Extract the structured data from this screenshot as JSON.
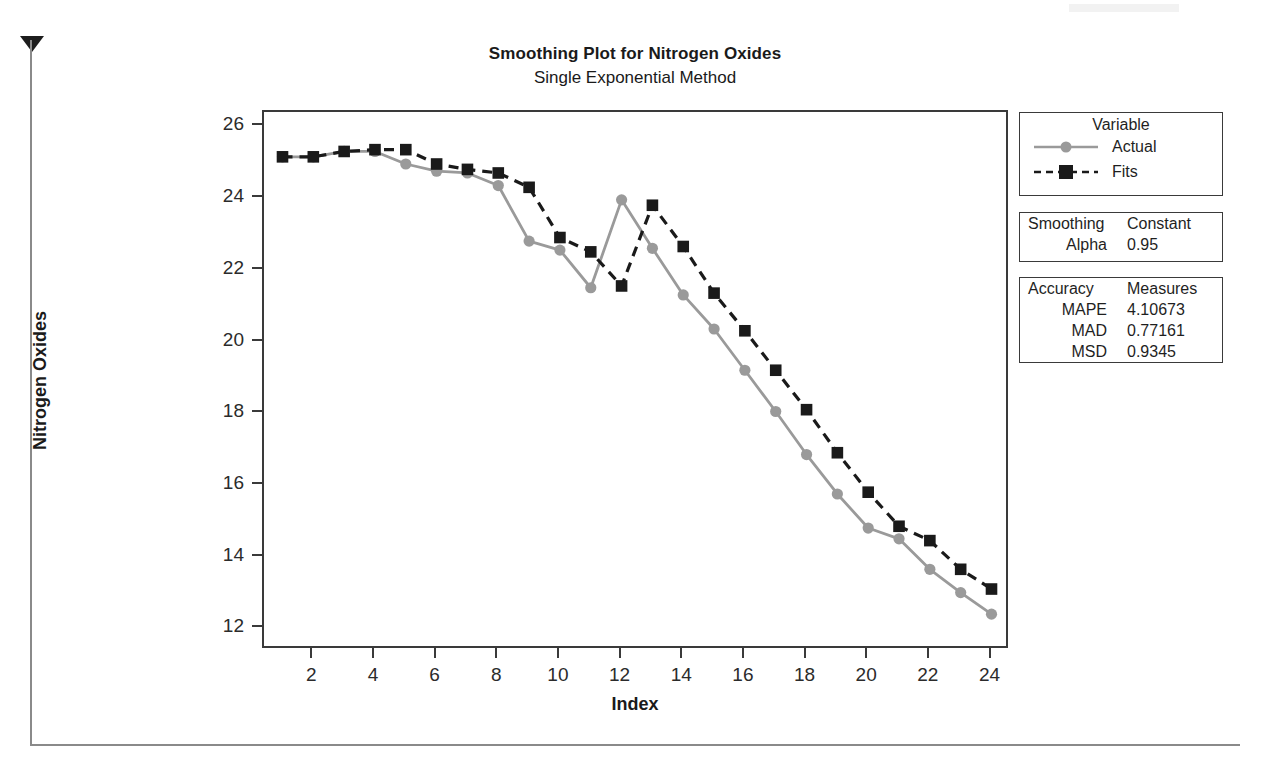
{
  "chart_data": {
    "type": "line",
    "title": "Smoothing Plot for Nitrogen Oxides",
    "subtitle": "Single Exponential Method",
    "xlabel": "Index",
    "ylabel": "Nitrogen Oxides",
    "grid": false,
    "legend_position": "right",
    "xlim": [
      0.4,
      24.6
    ],
    "ylim": [
      11.4,
      26.4
    ],
    "xticks": [
      2,
      4,
      6,
      8,
      10,
      12,
      14,
      16,
      18,
      20,
      22,
      24
    ],
    "yticks": [
      12,
      14,
      16,
      18,
      20,
      22,
      24,
      26
    ],
    "x": [
      1,
      2,
      3,
      4,
      5,
      6,
      7,
      8,
      9,
      10,
      11,
      12,
      13,
      14,
      15,
      16,
      17,
      18,
      19,
      20,
      21,
      22,
      23,
      24
    ],
    "series": [
      {
        "name": "Actual",
        "color": "#9a9a9a",
        "style": "solid",
        "marker": "circle",
        "values": [
          25.15,
          25.15,
          25.3,
          25.3,
          24.95,
          24.75,
          24.7,
          24.35,
          22.8,
          22.55,
          21.5,
          23.95,
          22.6,
          21.3,
          20.35,
          19.2,
          18.05,
          16.85,
          15.75,
          14.8,
          14.5,
          13.65,
          13.0,
          12.4
        ]
      },
      {
        "name": "Fits",
        "color": "#1a1a1a",
        "style": "dashed",
        "marker": "square",
        "values": [
          25.15,
          25.15,
          25.3,
          25.35,
          25.35,
          24.95,
          24.8,
          24.7,
          24.3,
          22.9,
          22.5,
          21.55,
          23.8,
          22.65,
          21.35,
          20.3,
          19.2,
          18.1,
          16.9,
          15.8,
          14.85,
          14.45,
          13.65,
          13.1
        ]
      }
    ]
  },
  "titles": {
    "main": "Smoothing Plot for Nitrogen Oxides",
    "sub": "Single Exponential Method"
  },
  "axes": {
    "x_title": "Index",
    "y_title": "Nitrogen Oxides",
    "x_ticks": [
      "2",
      "4",
      "6",
      "8",
      "10",
      "12",
      "14",
      "16",
      "18",
      "20",
      "22",
      "24"
    ],
    "y_ticks": [
      "26",
      "24",
      "22",
      "20",
      "18",
      "16",
      "14",
      "12"
    ]
  },
  "legend": {
    "title": "Variable",
    "entries": [
      {
        "label": "Actual",
        "color": "#9a9a9a",
        "style": "solid",
        "marker": "circle"
      },
      {
        "label": "Fits",
        "color": "#1a1a1a",
        "style": "dashed",
        "marker": "square"
      }
    ]
  },
  "smoothing": {
    "header_left": "Smoothing",
    "header_right": "Constant",
    "key": "Alpha",
    "value": "0.95"
  },
  "accuracy": {
    "header_left": "Accuracy",
    "header_right": "Measures",
    "rows": [
      {
        "key": "MAPE",
        "value": "4.10673"
      },
      {
        "key": "MAD",
        "value": "0.77161"
      },
      {
        "key": "MSD",
        "value": "0.9345"
      }
    ]
  },
  "colors": {
    "actual": "#9a9a9a",
    "fits": "#1a1a1a",
    "frame": "#3a3a3a",
    "page": "#ffffff"
  }
}
